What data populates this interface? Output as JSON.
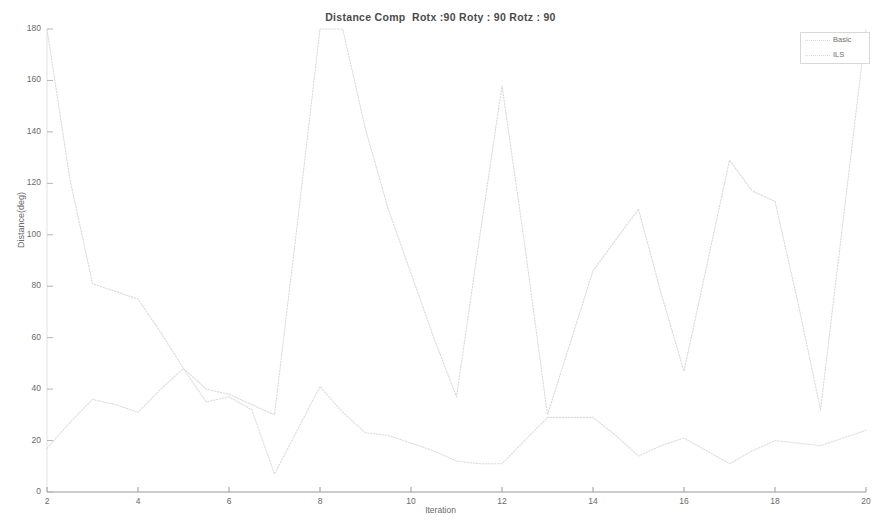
{
  "chart_data": {
    "type": "line",
    "title": "Distance Comp  Rotx :90 Roty : 90 Rotz : 90",
    "xlabel": "Iteration",
    "ylabel": "Distance(deg)",
    "xlim": [
      2,
      20
    ],
    "ylim": [
      0,
      180
    ],
    "xticks": [
      2,
      4,
      6,
      8,
      10,
      12,
      14,
      16,
      18,
      20
    ],
    "yticks": [
      0,
      20,
      40,
      60,
      80,
      100,
      120,
      140,
      160,
      180
    ],
    "grid": false,
    "legend_position": "top-right",
    "x": [
      2,
      2.5,
      3,
      3.5,
      4,
      4.5,
      5,
      5.5,
      6,
      6.5,
      7,
      7.5,
      8,
      8.5,
      9,
      9.5,
      10,
      10.5,
      11,
      11.5,
      12,
      12.5,
      13,
      13.5,
      14,
      14.5,
      15,
      15.5,
      16,
      16.5,
      17,
      17.5,
      18,
      18.5,
      19,
      19.5,
      20
    ],
    "series": [
      {
        "name": "Basic",
        "color": "#d9d9d9",
        "linestyle": "dotted",
        "values": [
          180,
          122,
          81,
          78,
          75,
          62,
          48,
          40,
          38,
          34,
          30,
          104,
          180,
          180,
          141,
          110,
          85,
          60,
          37,
          98,
          158,
          96,
          30,
          58,
          86,
          98,
          110,
          77,
          47,
          88,
          129,
          117,
          113,
          74,
          32,
          106,
          180
        ]
      },
      {
        "name": "ILS",
        "color": "#dcdcdc",
        "linestyle": "dotted",
        "values": [
          17,
          27,
          36,
          34,
          31,
          40,
          48,
          35,
          37,
          32,
          7,
          24,
          41,
          31,
          23,
          22,
          19,
          16,
          12,
          11,
          11,
          20,
          29,
          29,
          29,
          22,
          14,
          18,
          21,
          16,
          11,
          16,
          20,
          19,
          18,
          21,
          24
        ]
      }
    ]
  },
  "legend": {
    "items": [
      {
        "label": "Basic"
      },
      {
        "label": "ILS"
      }
    ]
  },
  "axes": {
    "x_tick_labels": [
      "2",
      "4",
      "6",
      "8",
      "10",
      "12",
      "14",
      "16",
      "18",
      "20"
    ],
    "y_tick_labels": [
      "0",
      "20",
      "40",
      "60",
      "80",
      "100",
      "120",
      "140",
      "160",
      "180"
    ]
  }
}
